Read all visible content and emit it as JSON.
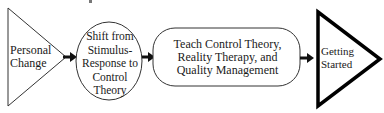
{
  "diagram": {
    "type": "flowchart",
    "direction": "left-to-right",
    "colors": {
      "stroke": "#1a1a1a",
      "background": "#ffffff"
    },
    "nodes": [
      {
        "id": "personal-change",
        "shape": "triangle-right-thin",
        "lines": [
          "Personal",
          "Change"
        ]
      },
      {
        "id": "shift",
        "shape": "circle",
        "lines": [
          "Shift from",
          "Stimulus-",
          "Response to",
          "Control",
          "Theory"
        ]
      },
      {
        "id": "teach",
        "shape": "rounded-rectangle",
        "lines": [
          "Teach Control Theory,",
          "Reality Therapy, and",
          "Quality Management"
        ]
      },
      {
        "id": "getting-started",
        "shape": "triangle-right-bold",
        "lines": [
          "Getting",
          "Started"
        ]
      }
    ],
    "edges": [
      {
        "from": "personal-change",
        "to": "shift",
        "style": "bold-arrow"
      },
      {
        "from": "shift",
        "to": "teach",
        "style": "bold-arrow"
      },
      {
        "from": "teach",
        "to": "getting-started",
        "style": "bold-arrow"
      }
    ]
  }
}
